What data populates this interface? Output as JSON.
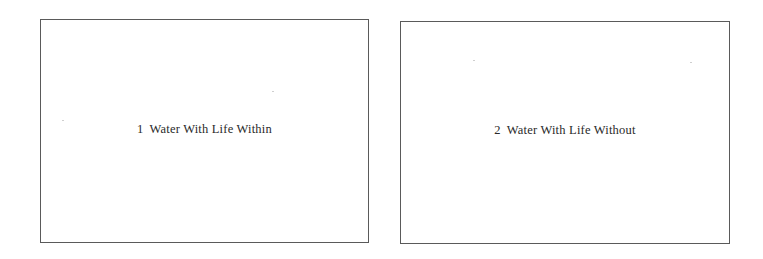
{
  "figures": [
    {
      "number": "1",
      "title": "Water With Life Within"
    },
    {
      "number": "2",
      "title": "Water With Life Without"
    }
  ],
  "colors": {
    "frame_border": "#5a5a5a",
    "text": "#2a2a2a",
    "background": "#ffffff"
  }
}
